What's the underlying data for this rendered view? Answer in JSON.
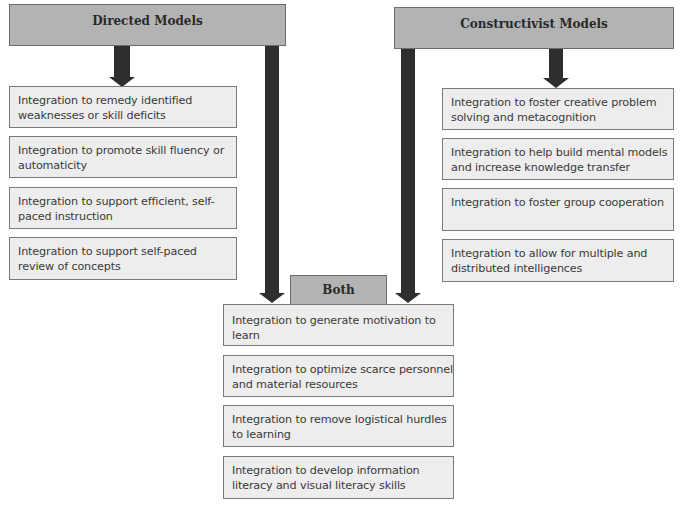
{
  "diagram": {
    "directed": {
      "title": "Directed Models",
      "items": [
        "Integration to remedy identified weaknesses or skill deficits",
        "Integration to promote skill fluency or automaticity",
        "Integration to support efficient, self-paced instruction",
        "Integration to support self-paced review of concepts"
      ]
    },
    "constructivist": {
      "title": "Constructivist Models",
      "items": [
        "Integration to foster creative problem solving and metacognition",
        "Integration to help build mental models and increase knowledge transfer",
        "Integration to foster group cooperation",
        "Integration to allow for multiple and distributed intelligences"
      ]
    },
    "both": {
      "title": "Both",
      "items": [
        "Integration to generate motivation to learn",
        "Integration to optimize scarce personnel and material resources",
        "Integration to remove logistical hurdles to learning",
        "Integration to develop information literacy and visual literacy skills"
      ]
    },
    "colors": {
      "header_fill": "#b3b3b3",
      "box_fill": "#ededed",
      "arrow": "#2e2e2e"
    }
  }
}
